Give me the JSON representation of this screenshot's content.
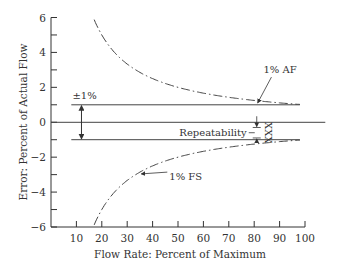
{
  "chart_data": {
    "type": "line",
    "title": "",
    "xlabel": "Flow Rate: Percent of Maximum",
    "ylabel": "Error: Percent of Actual Flow",
    "xlim": [
      0,
      100
    ],
    "ylim": [
      -6,
      6
    ],
    "x_ticks": [
      10,
      20,
      30,
      40,
      50,
      60,
      70,
      80,
      90,
      100
    ],
    "x_tick_labels": [
      "10",
      "20",
      "30",
      "40",
      "50",
      "60",
      "70",
      "80",
      "90",
      "100"
    ],
    "y_ticks": [
      6,
      5,
      4,
      3,
      2,
      1,
      0,
      -1,
      -2,
      -3,
      -4,
      -5,
      -6
    ],
    "y_tick_labels": [
      "6",
      "",
      "4",
      "",
      "2",
      "",
      "0",
      "",
      "−2",
      "",
      "−4",
      "",
      "−6"
    ],
    "grid": false,
    "series": [
      {
        "name": "1% FS (upper)",
        "style": "dash-dot",
        "x": [
          17,
          20,
          25,
          30,
          35,
          40,
          45,
          50,
          55,
          60,
          65,
          70,
          75,
          80,
          85,
          90,
          95,
          98
        ],
        "y": [
          5.88,
          5.0,
          4.0,
          3.33,
          2.86,
          2.5,
          2.22,
          2.0,
          1.82,
          1.67,
          1.54,
          1.43,
          1.33,
          1.25,
          1.18,
          1.11,
          1.05,
          1.02
        ]
      },
      {
        "name": "1% FS (lower)",
        "style": "dash-dot",
        "x": [
          17,
          20,
          25,
          30,
          35,
          40,
          45,
          50,
          55,
          60,
          65,
          70,
          75,
          80,
          85,
          90,
          95,
          98
        ],
        "y": [
          -5.88,
          -5.0,
          -4.0,
          -3.33,
          -2.86,
          -2.5,
          -2.22,
          -2.0,
          -1.82,
          -1.67,
          -1.54,
          -1.43,
          -1.33,
          -1.25,
          -1.18,
          -1.11,
          -1.05,
          -1.02
        ]
      },
      {
        "name": "1% AF (upper)",
        "style": "solid",
        "x": [
          8,
          98
        ],
        "y": [
          1,
          1
        ]
      },
      {
        "name": "1% AF (lower)",
        "style": "solid",
        "x": [
          8,
          98
        ],
        "y": [
          -1,
          -1
        ]
      },
      {
        "name": "zero",
        "style": "solid",
        "x": [
          0,
          108
        ],
        "y": [
          0,
          0
        ]
      }
    ],
    "annotations": [
      {
        "id": "pm1",
        "text": "±1%",
        "x": 12,
        "y": 1.3
      },
      {
        "id": "af",
        "text": "1% AF",
        "x": 86,
        "y": 1.9,
        "arrow_to": [
          81,
          1.0
        ]
      },
      {
        "id": "fs",
        "text": "1% FS",
        "x": 45,
        "y": -3.2,
        "arrow_to": [
          34,
          -2.9
        ]
      },
      {
        "id": "rep",
        "text": "Repeatability",
        "x": 60,
        "y": -0.6
      },
      {
        "id": "xxx",
        "text": "XXX",
        "x": 83,
        "y": -0.6
      }
    ],
    "repeatability_band": {
      "x": 81,
      "y_top": -0.3,
      "y_bottom": -0.9
    },
    "pm1_arrow": {
      "x": 12,
      "y_top": 1,
      "y_bottom": -1
    },
    "colors": {
      "line": "#444444",
      "axis": "#333333"
    }
  }
}
